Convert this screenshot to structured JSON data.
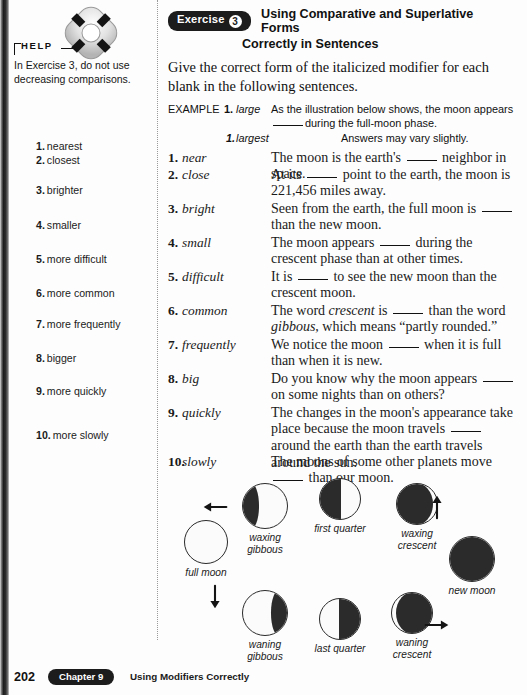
{
  "help": {
    "label": "HELP",
    "icon": "life-preserver-icon",
    "text": "In Exercise 3, do not use decreasing comparisons."
  },
  "answers": {
    "items": [
      {
        "num": "1.",
        "text": "nearest",
        "top": 0
      },
      {
        "num": "2.",
        "text": "closest",
        "top": 14
      },
      {
        "num": "3.",
        "text": "brighter",
        "top": 44
      },
      {
        "num": "4.",
        "text": "smaller",
        "top": 79
      },
      {
        "num": "5.",
        "text": "more difficult",
        "top": 113
      },
      {
        "num": "6.",
        "text": "more common",
        "top": 147
      },
      {
        "num": "7.",
        "text": "more frequently",
        "top": 178
      },
      {
        "num": "8.",
        "text": "bigger",
        "top": 212
      },
      {
        "num": "9.",
        "text": "more quickly",
        "top": 245
      },
      {
        "num": "10.",
        "text": "more slowly",
        "top": 289
      }
    ]
  },
  "exercise": {
    "badge_label": "Exercise",
    "badge_number": "3",
    "title_line1": "Using Comparative and Superlative Forms",
    "title_line2": "Correctly in Sentences",
    "directions": "Give the correct form of the italicized modifier for each blank in the following sentences.",
    "example": {
      "label": "EXAMPLE",
      "number": "1.",
      "word": "large",
      "sentence_part1": "As the illustration below shows, the moon appears",
      "sentence_part2": "during the full-moon phase.",
      "answer_number": "1.",
      "answer_word": "largest",
      "note": "Answers may vary slightly."
    },
    "questions": [
      {
        "num": "1.",
        "word": "near",
        "top": 0,
        "segments": [
          {
            "type": "text",
            "value": "The moon is the earth's "
          },
          {
            "type": "blank"
          },
          {
            "type": "text",
            "value": " neighbor in space."
          }
        ]
      },
      {
        "num": "2.",
        "word": "close",
        "top": 17,
        "segments": [
          {
            "type": "text",
            "value": "At its "
          },
          {
            "type": "blank"
          },
          {
            "type": "text",
            "value": " point to the earth, the moon is 221,456 miles away."
          }
        ]
      },
      {
        "num": "3.",
        "word": "bright",
        "top": 51,
        "segments": [
          {
            "type": "text",
            "value": "Seen from the earth, the full moon is "
          },
          {
            "type": "blank"
          },
          {
            "type": "text",
            "value": " than the new moon."
          }
        ]
      },
      {
        "num": "4.",
        "word": "small",
        "top": 85,
        "segments": [
          {
            "type": "text",
            "value": "The moon appears "
          },
          {
            "type": "blank"
          },
          {
            "type": "text",
            "value": " during the crescent phase than at other times."
          }
        ]
      },
      {
        "num": "5.",
        "word": "difficult",
        "top": 119,
        "segments": [
          {
            "type": "text",
            "value": "It is "
          },
          {
            "type": "blank"
          },
          {
            "type": "text",
            "value": " to see the new moon than the crescent moon."
          }
        ]
      },
      {
        "num": "6.",
        "word": "common",
        "top": 153,
        "segments": [
          {
            "type": "text",
            "value": "The word "
          },
          {
            "type": "italic",
            "value": "crescent"
          },
          {
            "type": "text",
            "value": " is "
          },
          {
            "type": "blank"
          },
          {
            "type": "text",
            "value": " than the word "
          },
          {
            "type": "italic",
            "value": "gibbous"
          },
          {
            "type": "text",
            "value": ", which means “partly rounded.”"
          }
        ]
      },
      {
        "num": "7.",
        "word": "frequently",
        "top": 187,
        "segments": [
          {
            "type": "text",
            "value": "We notice the moon "
          },
          {
            "type": "blank"
          },
          {
            "type": "text",
            "value": " when it is full than when it is new."
          }
        ]
      },
      {
        "num": "8.",
        "word": "big",
        "top": 221,
        "segments": [
          {
            "type": "text",
            "value": "Do you know why the moon appears "
          },
          {
            "type": "blank"
          },
          {
            "type": "text",
            "value": " on some nights than on others?"
          }
        ]
      },
      {
        "num": "9.",
        "word": "quickly",
        "top": 255,
        "segments": [
          {
            "type": "text",
            "value": "The changes in the moon's appearance take place because the moon travels "
          },
          {
            "type": "blank"
          },
          {
            "type": "text",
            "value": " around the earth than the earth travels around the sun."
          }
        ]
      },
      {
        "num": "10.",
        "word": "slowly",
        "top": 304,
        "segments": [
          {
            "type": "text",
            "value": "The moons of some other planets move "
          },
          {
            "type": "blank"
          },
          {
            "type": "text",
            "value": " than our moon."
          }
        ]
      }
    ]
  },
  "diagram": {
    "name": "moon-phases-diagram",
    "phases": [
      {
        "id": "full-moon",
        "label": "full moon",
        "size": 44,
        "lit": "full",
        "left": 6,
        "top": 42,
        "label_top": 3
      },
      {
        "id": "waxing-gibbous",
        "label": "waxing\ngibbous",
        "size": 46,
        "lit": "gibbous-left",
        "left": 65,
        "top": 5,
        "label_top": 3
      },
      {
        "id": "first-quarter",
        "label": "first quarter",
        "size": 42,
        "lit": "half-right",
        "left": 140,
        "top": 0,
        "label_top": 3
      },
      {
        "id": "waxing-crescent",
        "label": "waxing\ncrescent",
        "size": 42,
        "lit": "crescent-right",
        "left": 217,
        "top": 5,
        "label_top": 3
      },
      {
        "id": "new-moon",
        "label": "new moon",
        "size": 46,
        "lit": "new",
        "left": 272,
        "top": 58,
        "label_top": 3
      },
      {
        "id": "waning-gibbous",
        "label": "waning\ngibbous",
        "size": 46,
        "lit": "gibbous-right",
        "left": 65,
        "top": 112,
        "label_top": 3
      },
      {
        "id": "last-quarter",
        "label": "last quarter",
        "size": 42,
        "lit": "half-left",
        "left": 140,
        "top": 120,
        "label_top": 3
      },
      {
        "id": "waning-crescent",
        "label": "waning\ncrescent",
        "size": 42,
        "lit": "crescent-left",
        "left": 212,
        "top": 114,
        "label_top": 3
      }
    ],
    "arrows": [
      {
        "id": "arrow-full-to-waxing-gibbous",
        "left": 36,
        "top": 18,
        "rotate": 135
      },
      {
        "id": "arrow-full-to-waning-gibbous",
        "left": 36,
        "top": 108,
        "rotate": 45
      },
      {
        "id": "arrow-new-to-waxing-crescent",
        "left": 258,
        "top": 18,
        "rotate": 225
      },
      {
        "id": "arrow-new-to-waning-crescent",
        "left": 258,
        "top": 136,
        "rotate": 315
      }
    ]
  },
  "footer": {
    "page_number": "202",
    "chapter_label": "Chapter 9",
    "chapter_title": "Using Modifiers Correctly"
  }
}
